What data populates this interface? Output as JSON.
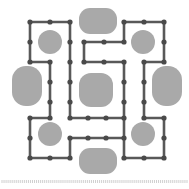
{
  "canvas": {
    "width": 189,
    "height": 189,
    "background_color": "#ffffff",
    "title": "grid puzzle board"
  },
  "style": {
    "edge_color": "#595959",
    "edge_width": 2.6,
    "node_color": "#4a4a4a",
    "node_radius": 2.6,
    "blob_fill": "#a9a9a9",
    "blob_stroke": "none",
    "ruler_color": "#c9c9c9",
    "ruler_dash": "1 2"
  },
  "grid": {
    "columns_x": [
      30,
      50,
      70,
      88,
      106,
      124,
      144,
      164
    ],
    "rows_y": [
      22,
      42,
      62,
      82,
      102,
      118,
      138,
      158
    ],
    "spacing_px": 20
  },
  "blobs": [
    {
      "name": "blob-top-center",
      "x": 79,
      "y": 8,
      "w": 38,
      "h": 26,
      "r": 11
    },
    {
      "name": "blob-topleft-small",
      "x": 38,
      "y": 30,
      "w": 24,
      "h": 24,
      "r": 12
    },
    {
      "name": "blob-topright-small",
      "x": 131,
      "y": 30,
      "w": 24,
      "h": 24,
      "r": 12
    },
    {
      "name": "blob-left-tall",
      "x": 12,
      "y": 66,
      "w": 30,
      "h": 40,
      "r": 14
    },
    {
      "name": "blob-center-large",
      "x": 79,
      "y": 73,
      "w": 34,
      "h": 34,
      "r": 12
    },
    {
      "name": "blob-right-tall",
      "x": 152,
      "y": 66,
      "w": 30,
      "h": 40,
      "r": 14
    },
    {
      "name": "blob-bottomleft-small",
      "x": 38,
      "y": 122,
      "w": 24,
      "h": 24,
      "r": 12
    },
    {
      "name": "blob-bottomright-small",
      "x": 131,
      "y": 122,
      "w": 24,
      "h": 24,
      "r": 12
    },
    {
      "name": "blob-bottom-center",
      "x": 79,
      "y": 148,
      "w": 38,
      "h": 26,
      "r": 11
    }
  ],
  "nodes": [
    {
      "id": "n1",
      "x": 30,
      "y": 22
    },
    {
      "id": "n2",
      "x": 50,
      "y": 22
    },
    {
      "id": "n3",
      "x": 70,
      "y": 22
    },
    {
      "id": "n4",
      "x": 124,
      "y": 22
    },
    {
      "id": "n5",
      "x": 144,
      "y": 22
    },
    {
      "id": "n6",
      "x": 164,
      "y": 22
    },
    {
      "id": "n7",
      "x": 30,
      "y": 42
    },
    {
      "id": "n8",
      "x": 70,
      "y": 42
    },
    {
      "id": "n9",
      "x": 84,
      "y": 42
    },
    {
      "id": "n10",
      "x": 104,
      "y": 42
    },
    {
      "id": "n11",
      "x": 124,
      "y": 42
    },
    {
      "id": "n12",
      "x": 164,
      "y": 42
    },
    {
      "id": "n13",
      "x": 30,
      "y": 62
    },
    {
      "id": "n14",
      "x": 50,
      "y": 62
    },
    {
      "id": "n15",
      "x": 70,
      "y": 62
    },
    {
      "id": "n16",
      "x": 84,
      "y": 62
    },
    {
      "id": "n17",
      "x": 104,
      "y": 62
    },
    {
      "id": "n18",
      "x": 124,
      "y": 62
    },
    {
      "id": "n19",
      "x": 144,
      "y": 62
    },
    {
      "id": "n20",
      "x": 164,
      "y": 62
    },
    {
      "id": "n21",
      "x": 50,
      "y": 82
    },
    {
      "id": "n22",
      "x": 70,
      "y": 82
    },
    {
      "id": "n23",
      "x": 124,
      "y": 82
    },
    {
      "id": "n24",
      "x": 144,
      "y": 82
    },
    {
      "id": "n25",
      "x": 50,
      "y": 102
    },
    {
      "id": "n26",
      "x": 70,
      "y": 102
    },
    {
      "id": "n27",
      "x": 124,
      "y": 102
    },
    {
      "id": "n28",
      "x": 144,
      "y": 102
    },
    {
      "id": "n29",
      "x": 30,
      "y": 118
    },
    {
      "id": "n30",
      "x": 50,
      "y": 118
    },
    {
      "id": "n31",
      "x": 70,
      "y": 118
    },
    {
      "id": "n32",
      "x": 88,
      "y": 118
    },
    {
      "id": "n33",
      "x": 106,
      "y": 118
    },
    {
      "id": "n34",
      "x": 124,
      "y": 118
    },
    {
      "id": "n35",
      "x": 144,
      "y": 118
    },
    {
      "id": "n36",
      "x": 164,
      "y": 118
    },
    {
      "id": "n37",
      "x": 30,
      "y": 138
    },
    {
      "id": "n38",
      "x": 70,
      "y": 138
    },
    {
      "id": "n39",
      "x": 88,
      "y": 138
    },
    {
      "id": "n40",
      "x": 106,
      "y": 138
    },
    {
      "id": "n41",
      "x": 124,
      "y": 138
    },
    {
      "id": "n42",
      "x": 164,
      "y": 138
    },
    {
      "id": "n43",
      "x": 30,
      "y": 158
    },
    {
      "id": "n44",
      "x": 50,
      "y": 158
    },
    {
      "id": "n45",
      "x": 70,
      "y": 158
    },
    {
      "id": "n46",
      "x": 124,
      "y": 158
    },
    {
      "id": "n47",
      "x": 144,
      "y": 158
    },
    {
      "id": "n48",
      "x": 164,
      "y": 158
    }
  ],
  "edges": [
    {
      "from": "n1",
      "to": "n2"
    },
    {
      "from": "n2",
      "to": "n3"
    },
    {
      "from": "n1",
      "to": "n7"
    },
    {
      "from": "n7",
      "to": "n13"
    },
    {
      "from": "n13",
      "to": "n14"
    },
    {
      "from": "n3",
      "to": "n8"
    },
    {
      "from": "n8",
      "to": "n15"
    },
    {
      "from": "n15",
      "to": "n22"
    },
    {
      "from": "n22",
      "to": "n26"
    },
    {
      "from": "n26",
      "to": "n31"
    },
    {
      "from": "n14",
      "to": "n21"
    },
    {
      "from": "n21",
      "to": "n25"
    },
    {
      "from": "n25",
      "to": "n30"
    },
    {
      "from": "n9",
      "to": "n10"
    },
    {
      "from": "n10",
      "to": "n11"
    },
    {
      "from": "n9",
      "to": "n16"
    },
    {
      "from": "n16",
      "to": "n17"
    },
    {
      "from": "n17",
      "to": "n18"
    },
    {
      "from": "n18",
      "to": "n23"
    },
    {
      "from": "n23",
      "to": "n27"
    },
    {
      "from": "n27",
      "to": "n34"
    },
    {
      "from": "n4",
      "to": "n5"
    },
    {
      "from": "n5",
      "to": "n6"
    },
    {
      "from": "n4",
      "to": "n11"
    },
    {
      "from": "n6",
      "to": "n12"
    },
    {
      "from": "n12",
      "to": "n20"
    },
    {
      "from": "n19",
      "to": "n20"
    },
    {
      "from": "n19",
      "to": "n24"
    },
    {
      "from": "n24",
      "to": "n28"
    },
    {
      "from": "n28",
      "to": "n35"
    },
    {
      "from": "n29",
      "to": "n30"
    },
    {
      "from": "n31",
      "to": "n32"
    },
    {
      "from": "n32",
      "to": "n33"
    },
    {
      "from": "n33",
      "to": "n34"
    },
    {
      "from": "n35",
      "to": "n36"
    },
    {
      "from": "n29",
      "to": "n37"
    },
    {
      "from": "n37",
      "to": "n43"
    },
    {
      "from": "n43",
      "to": "n44"
    },
    {
      "from": "n44",
      "to": "n45"
    },
    {
      "from": "n38",
      "to": "n39"
    },
    {
      "from": "n39",
      "to": "n40"
    },
    {
      "from": "n40",
      "to": "n41"
    },
    {
      "from": "n38",
      "to": "n45"
    },
    {
      "from": "n34",
      "to": "n41"
    },
    {
      "from": "n41",
      "to": "n46"
    },
    {
      "from": "n46",
      "to": "n47"
    },
    {
      "from": "n47",
      "to": "n48"
    },
    {
      "from": "n36",
      "to": "n42"
    },
    {
      "from": "n42",
      "to": "n48"
    }
  ],
  "ruler": {
    "name": "bottom-ruler",
    "y": 181,
    "x_start": 2,
    "x_end": 187,
    "tick_count": 92
  }
}
